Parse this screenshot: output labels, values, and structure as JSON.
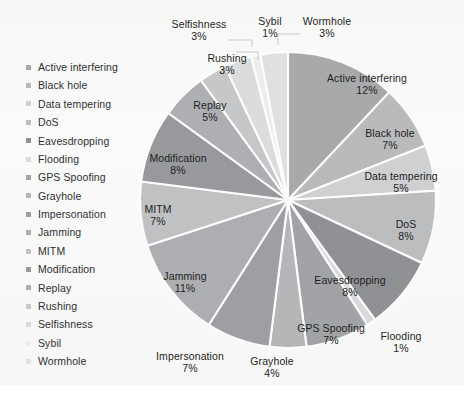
{
  "chart_data": {
    "type": "pie",
    "title": "",
    "subtitle": "",
    "xlabel": "",
    "ylabel": "",
    "legend_position": "left",
    "grid": false,
    "units": "percent",
    "start_angle_deg": 0,
    "direction": "clockwise",
    "categories": [
      "Active interfering",
      "Black hole",
      "Data tempering",
      "DoS",
      "Eavesdropping",
      "Flooding",
      "GPS Spoofing",
      "Grayhole",
      "Impersonation",
      "Jamming",
      "MITM",
      "Modification",
      "Replay",
      "Rushing",
      "Selfishness",
      "Sybil",
      "Wormhole"
    ],
    "values": [
      12,
      7,
      5,
      8,
      8,
      1,
      7,
      4,
      7,
      11,
      7,
      8,
      5,
      3,
      3,
      1,
      3
    ],
    "value_labels": [
      "12%",
      "7%",
      "5%",
      "8%",
      "8%",
      "1%",
      "7%",
      "4%",
      "7%",
      "11%",
      "7%",
      "8%",
      "5%",
      "3%",
      "3%",
      "1%",
      "3%"
    ],
    "slice_colors": [
      "#a8a9ab",
      "#b9babc",
      "#cfd0d2",
      "#bcbdbf",
      "#8f9194",
      "#d9dadc",
      "#a1a3a6",
      "#b4b6b8",
      "#9d9fa2",
      "#acaeb1",
      "#bfc1c3",
      "#97999c",
      "#adafb2",
      "#c6c7c9",
      "#dbdcde",
      "#eceded",
      "#dfe0e2"
    ],
    "slice_label_suffix": "%",
    "total": 100
  },
  "legend": {
    "items": [
      {
        "label": "Active interfering",
        "color": "#a8a9ab"
      },
      {
        "label": "Black hole",
        "color": "#b9babc"
      },
      {
        "label": "Data tempering",
        "color": "#cfd0d2"
      },
      {
        "label": "DoS",
        "color": "#bcbdbf"
      },
      {
        "label": "Eavesdropping",
        "color": "#8f9194"
      },
      {
        "label": "Flooding",
        "color": "#d9dadc"
      },
      {
        "label": "GPS Spoofing",
        "color": "#a1a3a6"
      },
      {
        "label": "Grayhole",
        "color": "#b4b6b8"
      },
      {
        "label": "Impersonation",
        "color": "#9d9fa2"
      },
      {
        "label": "Jamming",
        "color": "#acaeb1"
      },
      {
        "label": "MITM",
        "color": "#bfc1c3"
      },
      {
        "label": "Modification",
        "color": "#97999c"
      },
      {
        "label": "Replay",
        "color": "#adafb2"
      },
      {
        "label": "Rushing",
        "color": "#c6c7c9"
      },
      {
        "label": "Selfishness",
        "color": "#dbdcde"
      },
      {
        "label": "Sybil",
        "color": "#eceded"
      },
      {
        "label": "Wormhole",
        "color": "#dfe0e2"
      }
    ]
  },
  "labels": {
    "active_interfering": {
      "name": "Active interfering",
      "pct": "12%"
    },
    "black_hole": {
      "name": "Black hole",
      "pct": "7%"
    },
    "data_tempering": {
      "name": "Data tempering",
      "pct": "5%"
    },
    "dos": {
      "name": "DoS",
      "pct": "8%"
    },
    "eavesdropping": {
      "name": "Eavesdropping",
      "pct": "8%"
    },
    "flooding": {
      "name": "Flooding",
      "pct": "1%"
    },
    "gps_spoofing": {
      "name": "GPS Spoofing",
      "pct": "7%"
    },
    "grayhole": {
      "name": "Grayhole",
      "pct": "4%"
    },
    "impersonation": {
      "name": "Impersonation",
      "pct": "7%"
    },
    "jamming": {
      "name": "Jamming",
      "pct": "11%"
    },
    "mitm": {
      "name": "MITM",
      "pct": "7%"
    },
    "modification": {
      "name": "Modification",
      "pct": "8%"
    },
    "replay": {
      "name": "Replay",
      "pct": "5%"
    },
    "rushing": {
      "name": "Rushing",
      "pct": "3%"
    },
    "selfishness": {
      "name": "Selfishness",
      "pct": "3%"
    },
    "sybil": {
      "name": "Sybil",
      "pct": "1%"
    },
    "wormhole": {
      "name": "Wormhole",
      "pct": "3%"
    }
  }
}
